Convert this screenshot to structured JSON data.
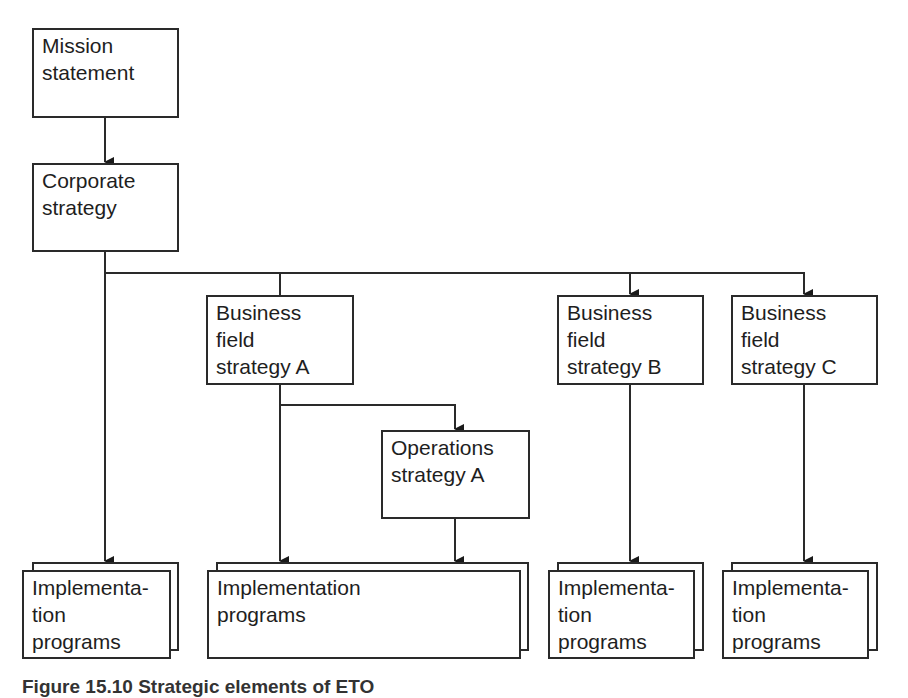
{
  "diagram": {
    "nodes": {
      "mission": {
        "lines": [
          "Mission",
          "statement"
        ]
      },
      "corporate": {
        "lines": [
          "Corporate",
          "strategy"
        ]
      },
      "bfs_a": {
        "lines": [
          "Business",
          "field",
          "strategy A"
        ]
      },
      "bfs_b": {
        "lines": [
          "Business",
          "field",
          "strategy B"
        ]
      },
      "bfs_c": {
        "lines": [
          "Business",
          "field",
          "strategy C"
        ]
      },
      "ops_a": {
        "lines": [
          "Operations",
          "strategy A"
        ]
      },
      "impl_1": {
        "lines": [
          "Implementa-",
          "tion",
          "programs"
        ]
      },
      "impl_2": {
        "lines": [
          "Implementation",
          "programs"
        ]
      },
      "impl_3": {
        "lines": [
          "Implementa-",
          "tion",
          "programs"
        ]
      },
      "impl_4": {
        "lines": [
          "Implementa-",
          "tion",
          "programs"
        ]
      }
    },
    "edges": [
      {
        "from": "Mission statement",
        "to": "Corporate strategy"
      },
      {
        "from": "Corporate strategy",
        "to": "Implementation programs (1)"
      },
      {
        "from": "Corporate strategy",
        "to": "Business field strategy A"
      },
      {
        "from": "Corporate strategy",
        "to": "Business field strategy B"
      },
      {
        "from": "Corporate strategy",
        "to": "Business field strategy C"
      },
      {
        "from": "Business field strategy A",
        "to": "Operations strategy A"
      },
      {
        "from": "Business field strategy A",
        "to": "Implementation programs (2)"
      },
      {
        "from": "Operations strategy A",
        "to": "Implementation programs (2)"
      },
      {
        "from": "Business field strategy B",
        "to": "Implementation programs (3)"
      },
      {
        "from": "Business field strategy C",
        "to": "Implementation programs (4)"
      }
    ],
    "colors": {
      "line": "#2a2a2a",
      "text": "#1e1e1e",
      "background": "#ffffff"
    }
  },
  "caption": "Figure 15.10  Strategic elements of ETO"
}
